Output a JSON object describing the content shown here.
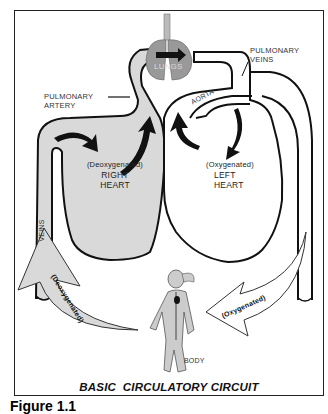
{
  "diagram": {
    "title": "BASIC  CIRCULATORY CIRCUIT",
    "figure_label": "Figure 1.1",
    "labels": {
      "lungs": "LUNGS",
      "pulmonary_veins_line1": "PULMONARY",
      "pulmonary_veins_line2": "VEINS",
      "pulmonary_artery_line1": "PULMONARY",
      "pulmonary_artery_line2": "ARTERY",
      "aorta": "AORTA",
      "veins": "VEINS",
      "body": "BODY",
      "right_heart_state": "(Deoxygenated)",
      "right_heart_line1": "RIGHT",
      "right_heart_line2": "HEART",
      "left_heart_state": "(Oxygenated)",
      "left_heart_line1": "LEFT",
      "left_heart_line2": "HEART",
      "deoxygenated_arrow": "(Deoxygenated)",
      "oxygenated_arrow": "(Oxygenated)"
    },
    "colors": {
      "deoxygenated_fill": "#d9d9d9",
      "oxygenated_fill": "#ffffff",
      "outline": "#111111",
      "arrow": "#111111"
    }
  }
}
